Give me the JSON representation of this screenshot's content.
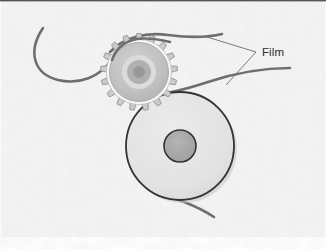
{
  "figure": {
    "canvas": {
      "width": 326,
      "height": 251
    },
    "background": {
      "color": "#f2f2f2",
      "texture": "mottled-paper-grain",
      "border_color": "#4a4a4a"
    },
    "annotations": [
      {
        "name": "film-label",
        "text": "Film",
        "x": 262,
        "y": 52,
        "leader": "two-pronged-wedge",
        "color": "#2b2b2b"
      }
    ],
    "parts": {
      "sprocket": {
        "name": "sprocket-wheel",
        "center_x": 139,
        "center_y": 72,
        "outer_radius": 36,
        "body_radius": 30,
        "tooth_count": 17,
        "body_color": "#bdbdbd",
        "rim_color": "#f5f5f5",
        "tooth_color": "#c9c9c9",
        "outline_color": "#8a8a8a",
        "hub_rings": [
          {
            "radius": 17,
            "color": "#d8d8d8"
          },
          {
            "radius": 12,
            "color": "#b0b0b0"
          },
          {
            "radius": 6,
            "color": "#9a9a9a"
          }
        ]
      },
      "roller": {
        "name": "roller-wheel",
        "center_x": 180,
        "center_y": 146,
        "radius": 54,
        "body_color": "#e2e2e2",
        "outline_color": "#333333",
        "hub_radius": 16,
        "hub_color": "#a8a8a8",
        "hub_outline_color": "#333333",
        "shadow_color": "#b8b8b8"
      },
      "film_strands": [
        {
          "name": "film-strand-upper-left",
          "description": "Enters from upper left, dips down, rises onto sprocket top",
          "color": "#6e6e6e",
          "width": 2.6
        },
        {
          "name": "film-strand-sprocket-top",
          "description": "Runs over top of sprocket toward upper right edge",
          "color": "#6e6e6e",
          "width": 2.6
        },
        {
          "name": "film-strand-roller-upper",
          "description": "Leaves roller top-left and exits to right edge",
          "color": "#6e6e6e",
          "width": 2.6
        },
        {
          "name": "film-strand-roller-lower",
          "description": "Leaves roller bottom and exits to lower right",
          "color": "#6e6e6e",
          "width": 2.6
        }
      ]
    }
  }
}
